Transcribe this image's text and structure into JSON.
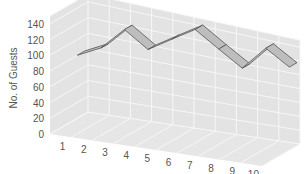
{
  "chart_data": {
    "type": "line",
    "style": "3d-ribbon",
    "title": "",
    "xlabel": "",
    "ylabel": "No. of Guests",
    "categories": [
      "1",
      "2",
      "3",
      "4",
      "5",
      "6",
      "7",
      "8",
      "9",
      "10"
    ],
    "series": [
      {
        "name": "Guests",
        "values": [
          80,
          95,
          125,
          105,
          125,
          145,
          125,
          105,
          140,
          120
        ]
      }
    ],
    "y_ticks": [
      0,
      20,
      40,
      60,
      80,
      100,
      120,
      140
    ],
    "ylim": [
      0,
      150
    ],
    "grid": true,
    "legend": null
  },
  "colors": {
    "wall": "#e3e3e3",
    "floor": "#e6e6e6",
    "grid": "#f7f7f7",
    "ribbon_fill": "#bdbdbd",
    "ribbon_stroke": "#555555",
    "text": "#555555"
  }
}
